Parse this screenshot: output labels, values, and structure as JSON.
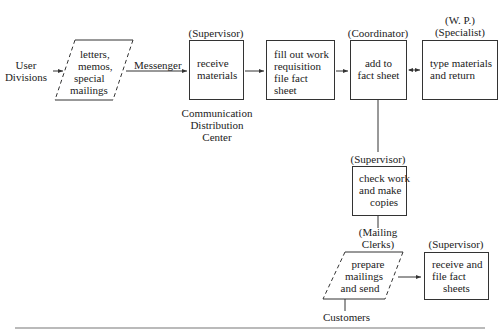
{
  "diagram": {
    "type": "flowchart",
    "source_label": {
      "line1": "User",
      "line2": "Divisions"
    },
    "input_doc": {
      "line1": "letters,",
      "line2": "memos,",
      "line3": "special",
      "line4": "mailings"
    },
    "edge_label_messenger": "Messenger",
    "nodes": [
      {
        "id": "receive",
        "role": "(Supervisor)",
        "lines": [
          "receive",
          "materials"
        ],
        "caption": [
          "Communication",
          "Distribution",
          "Center"
        ]
      },
      {
        "id": "fillout",
        "role": "",
        "lines": [
          "fill out work",
          "requisition",
          "file fact",
          "sheet"
        ]
      },
      {
        "id": "addfact",
        "role": "(Coordinator)",
        "lines": [
          "add to",
          "fact sheet"
        ]
      },
      {
        "id": "type",
        "role_line1": "(W. P.)",
        "role_line2": "(Specialist)",
        "lines": [
          "type materials",
          "and return"
        ]
      },
      {
        "id": "check",
        "role": "(Supervisor)",
        "lines": [
          "check work",
          "and make",
          "copies"
        ]
      },
      {
        "id": "prepare",
        "role_line1": "(Mailing",
        "role_line2": "Clerks)",
        "lines": [
          "prepare",
          "mailings",
          "and send"
        ],
        "shape": "parallelogram"
      },
      {
        "id": "filefact",
        "role": "(Supervisor)",
        "lines": [
          "receive and",
          "file fact",
          "sheets"
        ]
      }
    ],
    "sink_label": "Customers",
    "colors": {
      "stroke": "#333333",
      "text": "#222222",
      "background": "#ffffff"
    }
  }
}
